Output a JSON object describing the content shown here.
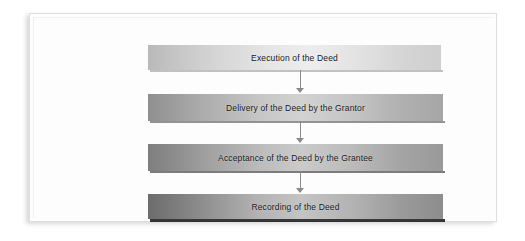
{
  "diagram": {
    "type": "vertical-flowchart",
    "orientation": "top-to-bottom",
    "panel_background": "#fdfdfd",
    "panel_border_color": "#dedede",
    "text_color": "#161616",
    "arrow_color": "#8a8a8a",
    "steps": [
      {
        "label": "Execution of the Deed"
      },
      {
        "label": "Delivery of the Deed by the Grantor"
      },
      {
        "label": "Acceptance of the Deed by the Grantee"
      },
      {
        "label": "Recording of the Deed"
      }
    ],
    "connectors": [
      {
        "name": "arrow-execution-to-delivery"
      },
      {
        "name": "arrow-delivery-to-acceptance"
      },
      {
        "name": "arrow-acceptance-to-recording"
      }
    ]
  }
}
